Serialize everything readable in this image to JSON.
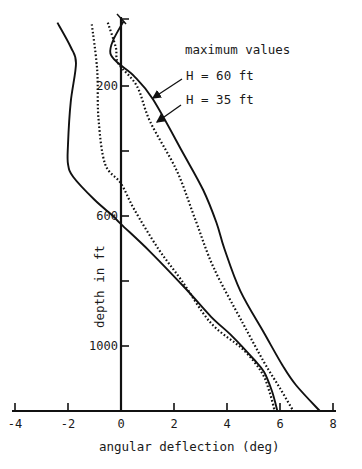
{
  "chart_data": {
    "type": "line",
    "title": "",
    "xlabel": "angular deflection (deg)",
    "ylabel": "depth in ft",
    "xlim": [
      -4,
      8
    ],
    "ylim": [
      1200,
      0
    ],
    "y_inverted": true,
    "grid": false,
    "x_ticks": [
      -4,
      -2,
      0,
      2,
      4,
      6,
      8
    ],
    "x_tick_labels": [
      "-4",
      "-2",
      "0",
      "2",
      "4",
      "6",
      "8"
    ],
    "y_ticks": [
      200,
      400,
      600,
      800,
      1000
    ],
    "y_tick_labels": [
      "200",
      "",
      "600",
      "",
      "1000"
    ],
    "annotations": [
      {
        "text": "maximum values"
      },
      {
        "text": "H = 60 ft",
        "points_to": "max_60"
      },
      {
        "text": "H = 35 ft",
        "points_to": "max_35"
      }
    ],
    "series": [
      {
        "name": "maximum values H = 60 ft",
        "id": "max_60",
        "style": "solid",
        "points": [
          [
            0.1,
            0
          ],
          [
            -0.3,
            60
          ],
          [
            -0.4,
            100
          ],
          [
            -0.1,
            130
          ],
          [
            0.5,
            170
          ],
          [
            1.2,
            240
          ],
          [
            2.3,
            400
          ],
          [
            3.1,
            520
          ],
          [
            3.6,
            620
          ],
          [
            3.9,
            700
          ],
          [
            4.5,
            830
          ],
          [
            5.4,
            960
          ],
          [
            6.1,
            1060
          ],
          [
            6.6,
            1120
          ],
          [
            7.5,
            1200
          ]
        ]
      },
      {
        "name": "maximum values H = 35 ft",
        "id": "max_35",
        "style": "dotted",
        "points": [
          [
            -0.5,
            5
          ],
          [
            -0.2,
            80
          ],
          [
            -0.1,
            130
          ],
          [
            0.6,
            200
          ],
          [
            1.1,
            310
          ],
          [
            2.1,
            460
          ],
          [
            2.8,
            610
          ],
          [
            3.5,
            760
          ],
          [
            4.6,
            930
          ],
          [
            5.4,
            1050
          ],
          [
            6.0,
            1130
          ],
          [
            6.5,
            1200
          ]
        ]
      },
      {
        "name": "minimum values H = 60 ft",
        "id": "min_60",
        "style": "solid",
        "points": [
          [
            -2.4,
            5
          ],
          [
            -1.9,
            80
          ],
          [
            -1.7,
            130
          ],
          [
            -1.9,
            250
          ],
          [
            -2.0,
            380
          ],
          [
            -2.0,
            440
          ],
          [
            -1.8,
            480
          ],
          [
            -1.0,
            550
          ],
          [
            -0.3,
            600
          ],
          [
            0,
            625
          ],
          [
            1.1,
            710
          ],
          [
            2.4,
            820
          ],
          [
            3.4,
            910
          ],
          [
            4.2,
            970
          ],
          [
            5.0,
            1040
          ],
          [
            5.4,
            1080
          ],
          [
            5.7,
            1140
          ],
          [
            5.9,
            1200
          ]
        ]
      },
      {
        "name": "minimum values H = 35 ft",
        "id": "min_35",
        "style": "dotted",
        "points": [
          [
            -1.1,
            10
          ],
          [
            -0.9,
            150
          ],
          [
            -0.85,
            300
          ],
          [
            -0.6,
            440
          ],
          [
            0,
            500
          ],
          [
            0.5,
            580
          ],
          [
            1.4,
            700
          ],
          [
            2.3,
            800
          ],
          [
            3.4,
            930
          ],
          [
            4.6,
            1010
          ],
          [
            5.3,
            1080
          ],
          [
            5.6,
            1140
          ],
          [
            5.8,
            1200
          ]
        ]
      }
    ]
  }
}
